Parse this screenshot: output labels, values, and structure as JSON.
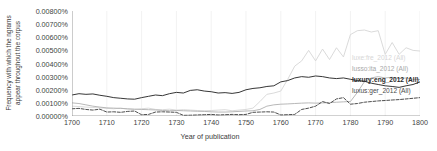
{
  "chart_data": {
    "type": "line",
    "title": "",
    "xlabel": "Year of publication",
    "ylabel_lines": [
      "Frequency with which the ngrams",
      "appear throughout the corpus"
    ],
    "ylabel": "Frequency with which the ngrams appear throughout the corpus",
    "xlim": [
      1700,
      1800
    ],
    "ylim": [
      0.0,
      0.008
    ],
    "ytick_labels": [
      "0.00000%",
      "0.00100%",
      "0.00200%",
      "0.00300%",
      "0.00400%",
      "0.00500%",
      "0.00600%",
      "0.00700%",
      "0.00800%"
    ],
    "ytick_values": [
      0.0,
      0.001,
      0.002,
      0.003,
      0.004,
      0.005,
      0.006,
      0.007,
      0.008
    ],
    "xtick_labels": [
      "1700",
      "1710",
      "1720",
      "1730",
      "1740",
      "1750",
      "1760",
      "1770",
      "1780",
      "1790",
      "1800"
    ],
    "xtick_values": [
      1700,
      1710,
      1720,
      1730,
      1740,
      1750,
      1760,
      1770,
      1780,
      1790,
      1800
    ],
    "grid": true,
    "grid_axis": "x",
    "legend_position": "right-inside",
    "series": [
      {
        "name": "luxe:fre_2012 (All)",
        "color": "#d6d6d6",
        "style": "solid",
        "x": [
          1700,
          1702,
          1704,
          1706,
          1708,
          1710,
          1712,
          1714,
          1716,
          1718,
          1720,
          1722,
          1724,
          1726,
          1728,
          1730,
          1732,
          1734,
          1736,
          1738,
          1740,
          1742,
          1744,
          1746,
          1748,
          1750,
          1752,
          1754,
          1756,
          1758,
          1760,
          1762,
          1764,
          1766,
          1768,
          1770,
          1772,
          1774,
          1776,
          1778,
          1780,
          1782,
          1784,
          1786,
          1788,
          1790,
          1792,
          1794,
          1796,
          1798,
          1800
        ],
        "values": [
          0.00075,
          0.00072,
          0.00068,
          0.00065,
          0.00062,
          0.00058,
          0.00055,
          0.0006,
          0.00052,
          0.0005,
          0.00055,
          0.0006,
          0.0005,
          0.00048,
          0.00052,
          0.00045,
          0.00048,
          0.00045,
          0.00042,
          0.0004,
          0.00042,
          0.00045,
          0.00048,
          0.0004,
          0.00045,
          0.0005,
          0.0006,
          0.0011,
          0.00165,
          0.00175,
          0.0019,
          0.0028,
          0.0038,
          0.0042,
          0.005,
          0.0042,
          0.0051,
          0.0043,
          0.0052,
          0.0045,
          0.0062,
          0.0065,
          0.00655,
          0.0064,
          0.0065,
          0.0047,
          0.0056,
          0.0047,
          0.0052,
          0.005,
          0.00495
        ]
      },
      {
        "name": "lusso:ita_2012 (All)",
        "color": "#b0b0b0",
        "style": "solid",
        "x": [
          1700,
          1702,
          1704,
          1706,
          1708,
          1710,
          1712,
          1714,
          1716,
          1718,
          1720,
          1722,
          1724,
          1726,
          1728,
          1730,
          1732,
          1734,
          1736,
          1738,
          1740,
          1742,
          1744,
          1746,
          1748,
          1750,
          1752,
          1754,
          1756,
          1758,
          1760,
          1762,
          1764,
          1766,
          1768,
          1770,
          1772,
          1774,
          1776,
          1778,
          1780,
          1782,
          1784,
          1786,
          1788,
          1790,
          1792,
          1794,
          1796,
          1798,
          1800
        ],
        "values": [
          0.001,
          0.00095,
          0.00085,
          0.00075,
          0.00068,
          0.00062,
          0.0006,
          0.00058,
          0.00055,
          0.00052,
          0.0005,
          0.00048,
          0.00046,
          0.00042,
          0.0004,
          0.00042,
          0.0004,
          0.00038,
          0.00036,
          0.00035,
          0.00032,
          0.0003,
          0.0003,
          0.00032,
          0.00035,
          0.00038,
          0.0004,
          0.0005,
          0.00075,
          0.00085,
          0.0009,
          0.00092,
          0.00095,
          0.00098,
          0.001,
          0.00098,
          0.001,
          0.00102,
          0.00105,
          0.00108,
          0.0011,
          0.0018,
          0.0026,
          0.0029,
          0.003,
          0.0029,
          0.00295,
          0.00285,
          0.0029,
          0.0028,
          0.00278
        ]
      },
      {
        "name": "luxury:eng_2012 (All)",
        "color": "#1f1f1f",
        "style": "solid",
        "x": [
          1700,
          1702,
          1704,
          1706,
          1708,
          1710,
          1712,
          1714,
          1716,
          1718,
          1720,
          1722,
          1724,
          1726,
          1728,
          1730,
          1732,
          1734,
          1736,
          1738,
          1740,
          1742,
          1744,
          1746,
          1748,
          1750,
          1752,
          1754,
          1756,
          1758,
          1760,
          1762,
          1764,
          1766,
          1768,
          1770,
          1772,
          1774,
          1776,
          1778,
          1780,
          1782,
          1784,
          1786,
          1788,
          1790,
          1792,
          1794,
          1796,
          1798,
          1800
        ],
        "values": [
          0.0016,
          0.0017,
          0.00165,
          0.00168,
          0.00158,
          0.0015,
          0.0014,
          0.00135,
          0.0013,
          0.00128,
          0.0014,
          0.0015,
          0.0016,
          0.00155,
          0.0017,
          0.0018,
          0.00175,
          0.00195,
          0.002,
          0.0019,
          0.00185,
          0.00175,
          0.00178,
          0.00172,
          0.0018,
          0.002,
          0.0021,
          0.00215,
          0.00225,
          0.0023,
          0.0026,
          0.0027,
          0.0029,
          0.003,
          0.00295,
          0.00305,
          0.003,
          0.0029,
          0.00285,
          0.0029,
          0.0028,
          0.0027,
          0.00265,
          0.0025,
          0.0024,
          0.0023,
          0.00225,
          0.00218,
          0.0023,
          0.0024,
          0.0026
        ]
      },
      {
        "name": "luxus:ger_2012 (All)",
        "color": "#3a3a3a",
        "style": "dashed",
        "x": [
          1700,
          1702,
          1704,
          1706,
          1708,
          1710,
          1712,
          1714,
          1716,
          1718,
          1720,
          1722,
          1724,
          1726,
          1728,
          1730,
          1732,
          1734,
          1736,
          1738,
          1740,
          1742,
          1744,
          1746,
          1748,
          1750,
          1752,
          1754,
          1756,
          1758,
          1760,
          1762,
          1764,
          1766,
          1768,
          1770,
          1772,
          1774,
          1776,
          1778,
          1780,
          1782,
          1784,
          1786,
          1788,
          1790,
          1792,
          1794,
          1796,
          1798,
          1800
        ],
        "values": [
          0.00055,
          0.00058,
          0.0005,
          0.00045,
          0.00052,
          0.0003,
          0.00032,
          0.00028,
          0.00035,
          0.00038,
          0.0001,
          0.00012,
          0.0003,
          0.00032,
          0.0003,
          0.00028,
          5e-05,
          6e-05,
          8e-05,
          0.0001,
          0.00012,
          8e-05,
          0.0001,
          0.00012,
          0.0001,
          0.00012,
          0.00028,
          0.0003,
          0.00032,
          0.0003,
          8e-05,
          0.0001,
          0.00012,
          0.0005,
          0.0006,
          0.00075,
          0.0011,
          0.00095,
          0.0013,
          0.0014,
          0.0009,
          0.00095,
          0.00105,
          0.0011,
          0.00115,
          0.00118,
          0.00122,
          0.00125,
          0.0013,
          0.00135,
          0.0014
        ]
      }
    ]
  }
}
